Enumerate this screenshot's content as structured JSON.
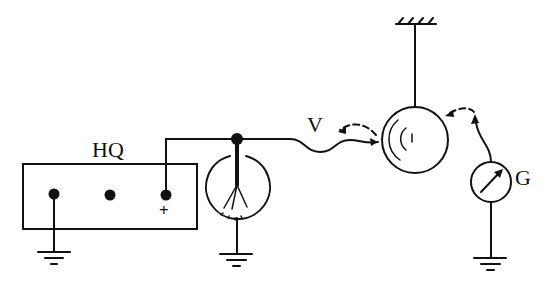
{
  "diagram": {
    "type": "circuit-schematic",
    "labels": {
      "source": "HQ",
      "wire": "V",
      "meter": "G",
      "plus_terminal": "+"
    },
    "components": [
      {
        "id": "hq-source",
        "label": "HQ",
        "kind": "voltage source box with three terminals"
      },
      {
        "id": "electroscope",
        "kind": "leaf electroscope"
      },
      {
        "id": "sphere",
        "kind": "suspended sphere"
      },
      {
        "id": "galvanometer",
        "label": "G",
        "kind": "meter"
      },
      {
        "id": "ceiling",
        "kind": "fixed support"
      }
    ],
    "colors": {
      "ink": "#111111",
      "background": "#ffffff"
    }
  }
}
